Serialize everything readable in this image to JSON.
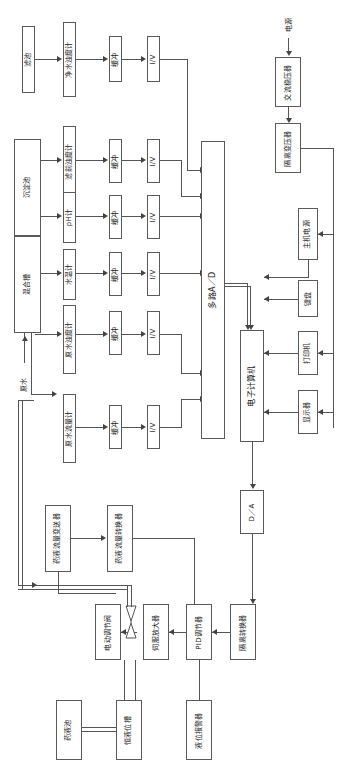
{
  "diagram": {
    "type": "block-diagram",
    "orientation": "rotated-90-ccw",
    "line_color": "#555555",
    "box_border_color": "#5a5a5a",
    "background": "#ffffff"
  },
  "process_tanks": [
    {
      "id": "filter-tank",
      "label": "滤池"
    },
    {
      "id": "sedimentation-tank",
      "label": "沉淀池"
    },
    {
      "id": "mixing-tank",
      "label": "混合槽"
    }
  ],
  "flow_labels": [
    {
      "id": "raw-water",
      "label": "原水"
    }
  ],
  "sensors": [
    {
      "id": "clean-water-turbidity-meter",
      "label": "净水浊度计"
    },
    {
      "id": "pre-filter-turbidity-meter",
      "label": "滤前浊度计"
    },
    {
      "id": "ph-meter",
      "label": "pH计"
    },
    {
      "id": "water-temperature-meter",
      "label": "水温计"
    },
    {
      "id": "raw-water-turbidity-meter",
      "label": "原水浊度计"
    },
    {
      "id": "raw-water-flow-meter",
      "label": "原水流量计"
    }
  ],
  "buffers": [
    {
      "id": "buffer-1",
      "label": "缓冲"
    },
    {
      "id": "buffer-2",
      "label": "缓冲"
    },
    {
      "id": "buffer-3",
      "label": "缓冲"
    },
    {
      "id": "buffer-4",
      "label": "缓冲"
    },
    {
      "id": "buffer-5",
      "label": "缓冲"
    },
    {
      "id": "buffer-6",
      "label": "缓冲"
    }
  ],
  "converters": [
    {
      "id": "iv-converter-1",
      "label": "I/V"
    },
    {
      "id": "iv-converter-2",
      "label": "I/V"
    },
    {
      "id": "iv-converter-3",
      "label": "I/V"
    },
    {
      "id": "iv-converter-4",
      "label": "I/V"
    },
    {
      "id": "iv-converter-5",
      "label": "I/V"
    },
    {
      "id": "iv-converter-6",
      "label": "I/V"
    }
  ],
  "computer_section": {
    "multiplex_ad": "多路A／D",
    "computer": "电子计算机",
    "da_converter": "D／A",
    "host_power": "主机电源",
    "keyboard": "键盘",
    "printer": "打印机",
    "display": "显示器"
  },
  "power_chain": [
    {
      "id": "power-source",
      "label": "电源"
    },
    {
      "id": "ac-voltage-stabilizer",
      "label": "交流稳压器"
    },
    {
      "id": "isolation-transformer",
      "label": "隔离变压器"
    }
  ],
  "dosing_control": [
    {
      "id": "dose-flow-transmitter",
      "label": "药液流量变送器"
    },
    {
      "id": "dose-flow-converter",
      "label": "药液流量转换器"
    },
    {
      "id": "electric-control-valve",
      "label": "电动调节阀"
    },
    {
      "id": "servo-amplifier",
      "label": "伺服放大器"
    },
    {
      "id": "pid-regulator",
      "label": "PID调节器"
    },
    {
      "id": "isolation-converter",
      "label": "隔离转换器"
    }
  ],
  "dosing_supply": [
    {
      "id": "chemical-tank",
      "label": "药液池"
    },
    {
      "id": "constant-level-tank",
      "label": "恒液位槽"
    },
    {
      "id": "level-alarm",
      "label": "液位报警器"
    }
  ]
}
